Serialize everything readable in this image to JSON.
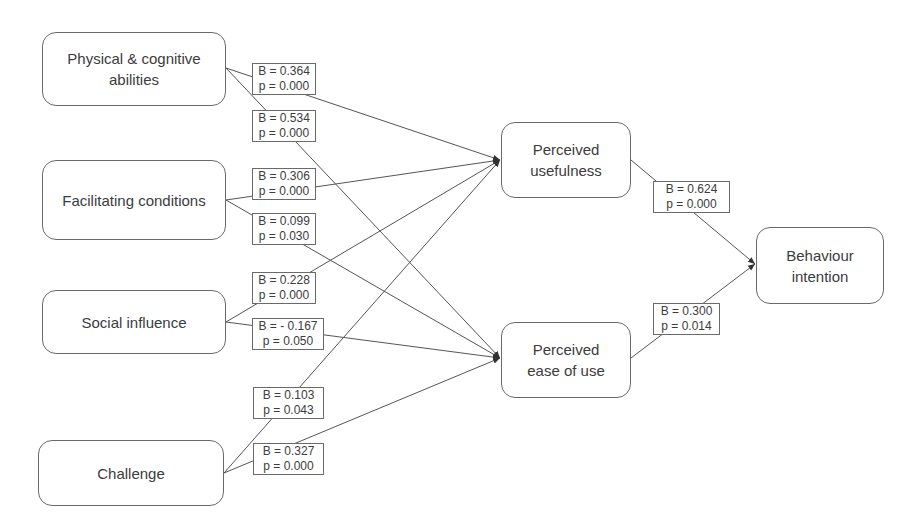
{
  "diagram": {
    "type": "path-model",
    "nodes": {
      "physical": {
        "label": "Physical & cognitive abilities"
      },
      "facilitating": {
        "label": "Facilitating conditions"
      },
      "social": {
        "label": "Social influence"
      },
      "challenge": {
        "label": "Challenge"
      },
      "usefulness": {
        "label": "Perceived usefulness"
      },
      "ease": {
        "label": "Perceived ease of use"
      },
      "intention": {
        "label": "Behaviour intention"
      }
    },
    "edges": [
      {
        "from": "Physical & cognitive abilities",
        "to": "Perceived usefulness",
        "B": "B = 0.364",
        "p": "p = 0.000"
      },
      {
        "from": "Physical & cognitive abilities",
        "to": "Perceived ease of use",
        "B": "B = 0.534",
        "p": "p = 0.000"
      },
      {
        "from": "Facilitating conditions",
        "to": "Perceived usefulness",
        "B": "B = 0.306",
        "p": "p = 0.000"
      },
      {
        "from": "Facilitating conditions",
        "to": "Perceived ease of use",
        "B": "B = 0.099",
        "p": "p = 0.030"
      },
      {
        "from": "Social influence",
        "to": "Perceived usefulness",
        "B": "B = 0.228",
        "p": "p = 0.000"
      },
      {
        "from": "Social influence",
        "to": "Perceived ease of use",
        "B": "B = - 0.167",
        "p": "p = 0.050"
      },
      {
        "from": "Challenge",
        "to": "Perceived usefulness",
        "B": "B = 0.103",
        "p": "p = 0.043"
      },
      {
        "from": "Challenge",
        "to": "Perceived ease of use",
        "B": "B = 0.327",
        "p": "p = 0.000"
      },
      {
        "from": "Perceived usefulness",
        "to": "Behaviour intention",
        "B": "B = 0.624",
        "p": "p = 0.000"
      },
      {
        "from": "Perceived ease of use",
        "to": "Behaviour intention",
        "B": "B = 0.300",
        "p": "p = 0.014"
      }
    ]
  }
}
